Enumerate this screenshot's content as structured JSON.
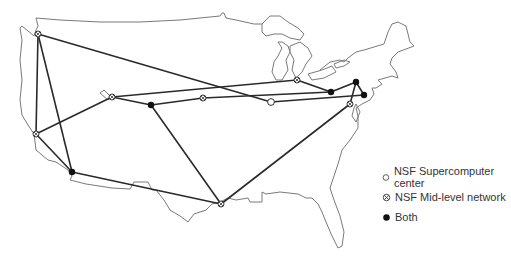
{
  "map": {
    "title": "NSFNET backbone map",
    "colors": {
      "link": "#2a2a2a",
      "outline": "#7a7a7a",
      "marker": "#111111"
    },
    "nodes": [
      {
        "id": "seattle",
        "type": "mid-level",
        "x": 38,
        "y": 34
      },
      {
        "id": "salt-lake",
        "type": "mid-level",
        "x": 112,
        "y": 97
      },
      {
        "id": "boulder",
        "type": "both",
        "x": 151,
        "y": 105
      },
      {
        "id": "lincoln",
        "type": "mid-level",
        "x": 203,
        "y": 98
      },
      {
        "id": "urbana",
        "type": "supercomputer",
        "x": 271,
        "y": 102
      },
      {
        "id": "ann-arbor",
        "type": "mid-level",
        "x": 297,
        "y": 80
      },
      {
        "id": "pittsburgh",
        "type": "both",
        "x": 331,
        "y": 92
      },
      {
        "id": "ithaca",
        "type": "both",
        "x": 356,
        "y": 82
      },
      {
        "id": "princeton",
        "type": "both",
        "x": 364,
        "y": 95
      },
      {
        "id": "college-park",
        "type": "mid-level",
        "x": 350,
        "y": 104
      },
      {
        "id": "palo-alto",
        "type": "mid-level",
        "x": 36,
        "y": 134
      },
      {
        "id": "san-diego",
        "type": "both",
        "x": 72,
        "y": 172
      },
      {
        "id": "houston",
        "type": "mid-level",
        "x": 221,
        "y": 204
      }
    ]
  },
  "legend": {
    "items": [
      {
        "marker": "open-circle",
        "label": "NSF Supercomputer center"
      },
      {
        "marker": "crossed-circle",
        "label": "NSF Mid-level network"
      },
      {
        "marker": "filled-circle",
        "label": "Both"
      }
    ]
  }
}
